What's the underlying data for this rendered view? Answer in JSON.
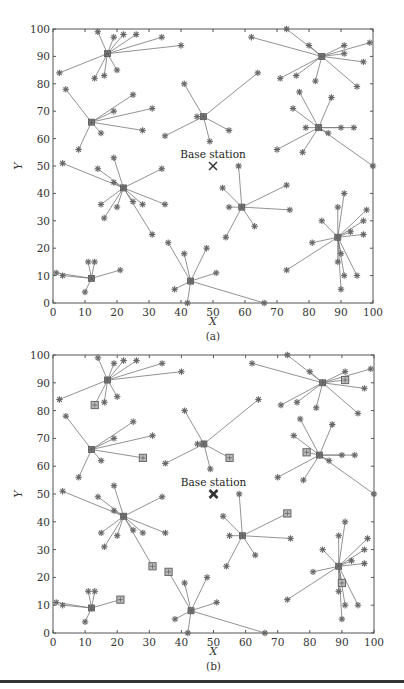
{
  "figure": {
    "rule_color": "#333333",
    "line_color": "#777777",
    "marker_color": "#666666"
  },
  "chart_data": [
    {
      "type": "scatter",
      "panel_label": "(a)",
      "title": "",
      "xlabel": "X",
      "ylabel": "Y",
      "xlim": [
        0,
        100
      ],
      "ylim": [
        0,
        100
      ],
      "xticks": [
        "0",
        "10",
        "20",
        "30",
        "40",
        "50",
        "60",
        "70",
        "80",
        "90",
        "100"
      ],
      "yticks": [
        "0",
        "10",
        "20",
        "30",
        "40",
        "50",
        "60",
        "70",
        "80",
        "90",
        "100"
      ],
      "grid": false,
      "base_station": {
        "label": "Base station",
        "x": 50,
        "y": 50,
        "marker": "x"
      },
      "clusters": [
        {
          "head": [
            17,
            91
          ],
          "members": [
            [
              14,
              99
            ],
            [
              19,
              97
            ],
            [
              22,
              98
            ],
            [
              26,
              98
            ],
            [
              34,
              97
            ],
            [
              40,
              94
            ],
            [
              2,
              84
            ],
            [
              13,
              82
            ],
            [
              16,
              83
            ],
            [
              20,
              85
            ]
          ]
        },
        {
          "head": [
            12,
            66
          ],
          "members": [
            [
              4,
              78
            ],
            [
              25,
              76
            ],
            [
              19,
              70
            ],
            [
              31,
              71
            ],
            [
              28,
              63
            ],
            [
              15,
              62
            ],
            [
              8,
              56
            ]
          ]
        },
        {
          "head": [
            47,
            68
          ],
          "members": [
            [
              41,
              80
            ],
            [
              64,
              84
            ],
            [
              45,
              68
            ],
            [
              35,
              61
            ],
            [
              49,
              59
            ],
            [
              55,
              63
            ]
          ]
        },
        {
          "head": [
            84,
            90
          ],
          "members": [
            [
              62,
              97
            ],
            [
              73,
              100
            ],
            [
              80,
              94
            ],
            [
              91,
              94
            ],
            [
              99,
              95
            ],
            [
              91,
              91
            ],
            [
              97,
              88
            ],
            [
              71,
              82
            ],
            [
              76,
              83
            ],
            [
              82,
              81
            ],
            [
              95,
              79
            ]
          ]
        },
        {
          "head": [
            83,
            64
          ],
          "members": [
            [
              77,
              77
            ],
            [
              75,
              71
            ],
            [
              87,
              75
            ],
            [
              79,
              64
            ],
            [
              90,
              64
            ],
            [
              94,
              64
            ],
            [
              86,
              62
            ],
            [
              70,
              56
            ],
            [
              78,
              55
            ],
            [
              100,
              50
            ]
          ]
        },
        {
          "head": [
            22,
            42
          ],
          "members": [
            [
              3,
              51
            ],
            [
              14,
              49
            ],
            [
              19,
              53
            ],
            [
              19,
              44
            ],
            [
              34,
              49
            ],
            [
              15,
              36
            ],
            [
              20,
              35
            ],
            [
              25,
              37
            ],
            [
              28,
              36
            ],
            [
              35,
              36
            ],
            [
              16,
              31
            ],
            [
              31,
              25
            ]
          ]
        },
        {
          "head": [
            59,
            35
          ],
          "members": [
            [
              58,
              50
            ],
            [
              53,
              42
            ],
            [
              73,
              43
            ],
            [
              55,
              35
            ],
            [
              74,
              34
            ],
            [
              63,
              28
            ],
            [
              54,
              24
            ]
          ]
        },
        {
          "head": [
            89,
            24
          ],
          "members": [
            [
              89,
              35
            ],
            [
              91,
              40
            ],
            [
              84,
              30
            ],
            [
              98,
              34
            ],
            [
              97,
              30
            ],
            [
              93,
              26
            ],
            [
              97,
              25
            ],
            [
              81,
              22
            ],
            [
              90,
              18
            ],
            [
              89,
              15
            ],
            [
              91,
              10
            ],
            [
              95,
              10
            ],
            [
              90,
              5
            ],
            [
              73,
              12
            ]
          ]
        },
        {
          "head": [
            12,
            9
          ],
          "members": [
            [
              1,
              11
            ],
            [
              3,
              10
            ],
            [
              11,
              15
            ],
            [
              13,
              15
            ],
            [
              21,
              12
            ],
            [
              10,
              4
            ]
          ]
        },
        {
          "head": [
            43,
            8
          ],
          "members": [
            [
              36,
              22
            ],
            [
              41,
              18
            ],
            [
              48,
              20
            ],
            [
              51,
              11
            ],
            [
              38,
              5
            ],
            [
              42,
              0
            ],
            [
              66,
              0
            ]
          ]
        }
      ]
    },
    {
      "type": "scatter",
      "panel_label": "(b)",
      "title": "",
      "xlabel": "X",
      "ylabel": "Y",
      "xlim": [
        0,
        100
      ],
      "ylim": [
        0,
        100
      ],
      "xticks": [
        "0",
        "10",
        "20",
        "30",
        "40",
        "50",
        "60",
        "70",
        "80",
        "90",
        "100"
      ],
      "yticks": [
        "0",
        "10",
        "20",
        "30",
        "40",
        "50",
        "60",
        "70",
        "80",
        "90",
        "100"
      ],
      "grid": false,
      "base_station": {
        "label": "Base station",
        "x": 50,
        "y": 50,
        "marker": "bold-x"
      },
      "clusters": [
        {
          "head": [
            17,
            91
          ],
          "members": [
            [
              14,
              99
            ],
            [
              19,
              97
            ],
            [
              22,
              98
            ],
            [
              26,
              98
            ],
            [
              34,
              97
            ],
            [
              40,
              94
            ],
            [
              2,
              84
            ],
            [
              13,
              82,
              "sq"
            ],
            [
              16,
              83
            ],
            [
              20,
              85
            ]
          ]
        },
        {
          "head": [
            12,
            66
          ],
          "members": [
            [
              4,
              78
            ],
            [
              25,
              76
            ],
            [
              19,
              70
            ],
            [
              31,
              71
            ],
            [
              28,
              63,
              "sq"
            ],
            [
              15,
              62
            ],
            [
              8,
              56
            ]
          ]
        },
        {
          "head": [
            47,
            68
          ],
          "members": [
            [
              41,
              80
            ],
            [
              64,
              84
            ],
            [
              45,
              68
            ],
            [
              35,
              61
            ],
            [
              49,
              59
            ],
            [
              55,
              63,
              "sq"
            ]
          ]
        },
        {
          "head": [
            84,
            90
          ],
          "members": [
            [
              62,
              97
            ],
            [
              73,
              100
            ],
            [
              80,
              94
            ],
            [
              91,
              94
            ],
            [
              99,
              95
            ],
            [
              91,
              91,
              "sq"
            ],
            [
              97,
              88
            ],
            [
              71,
              82
            ],
            [
              76,
              83
            ],
            [
              82,
              81
            ],
            [
              95,
              79
            ]
          ]
        },
        {
          "head": [
            83,
            64
          ],
          "members": [
            [
              77,
              77
            ],
            [
              75,
              71
            ],
            [
              87,
              75
            ],
            [
              79,
              65,
              "sq"
            ],
            [
              90,
              64
            ],
            [
              94,
              64
            ],
            [
              86,
              62
            ],
            [
              70,
              56
            ],
            [
              78,
              55
            ],
            [
              100,
              50
            ]
          ]
        },
        {
          "head": [
            22,
            42
          ],
          "members": [
            [
              3,
              51
            ],
            [
              14,
              49
            ],
            [
              19,
              53
            ],
            [
              19,
              44
            ],
            [
              34,
              49
            ],
            [
              15,
              36
            ],
            [
              20,
              35
            ],
            [
              25,
              37
            ],
            [
              28,
              36
            ],
            [
              35,
              36
            ],
            [
              16,
              31
            ],
            [
              31,
              24,
              "sq"
            ]
          ]
        },
        {
          "head": [
            59,
            35
          ],
          "members": [
            [
              58,
              50
            ],
            [
              53,
              42
            ],
            [
              73,
              43,
              "sq"
            ],
            [
              55,
              35
            ],
            [
              74,
              34
            ],
            [
              63,
              28
            ],
            [
              54,
              24
            ]
          ]
        },
        {
          "head": [
            89,
            24
          ],
          "members": [
            [
              89,
              35
            ],
            [
              91,
              40
            ],
            [
              84,
              30
            ],
            [
              98,
              34
            ],
            [
              97,
              30
            ],
            [
              93,
              26
            ],
            [
              97,
              25
            ],
            [
              81,
              22
            ],
            [
              90,
              18,
              "sq"
            ],
            [
              89,
              15
            ],
            [
              91,
              10
            ],
            [
              95,
              10
            ],
            [
              90,
              5
            ],
            [
              73,
              12
            ]
          ]
        },
        {
          "head": [
            12,
            9
          ],
          "members": [
            [
              1,
              11
            ],
            [
              3,
              10
            ],
            [
              11,
              15
            ],
            [
              13,
              15
            ],
            [
              21,
              12,
              "sq"
            ],
            [
              10,
              4
            ]
          ]
        },
        {
          "head": [
            43,
            8
          ],
          "members": [
            [
              36,
              22,
              "sq"
            ],
            [
              41,
              18
            ],
            [
              48,
              20
            ],
            [
              51,
              11
            ],
            [
              38,
              5
            ],
            [
              42,
              0
            ],
            [
              66,
              0
            ]
          ]
        }
      ]
    }
  ]
}
